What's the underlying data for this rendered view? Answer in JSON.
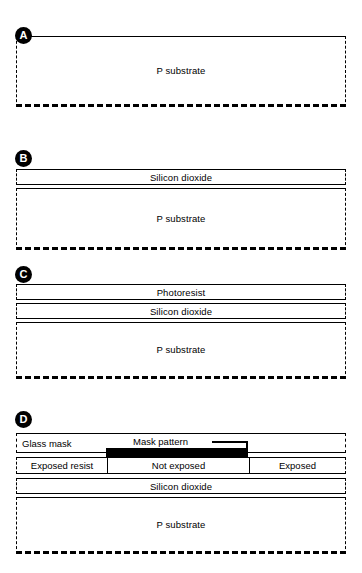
{
  "figure": {
    "background": "#ffffff",
    "ink": "#000000"
  },
  "panels": [
    {
      "id": "A",
      "badge": "A",
      "layers": [
        {
          "name": "p-substrate",
          "label": "P substrate",
          "style": "substrate"
        }
      ]
    },
    {
      "id": "B",
      "badge": "B",
      "layers": [
        {
          "name": "silicon-dioxide",
          "label": "Silicon dioxide",
          "style": "film"
        },
        {
          "name": "p-substrate",
          "label": "P substrate",
          "style": "substrate"
        }
      ]
    },
    {
      "id": "C",
      "badge": "C",
      "layers": [
        {
          "name": "photoresist",
          "label": "Photoresist",
          "style": "film"
        },
        {
          "name": "silicon-dioxide",
          "label": "Silicon dioxide",
          "style": "film"
        },
        {
          "name": "p-substrate",
          "label": "P substrate",
          "style": "substrate"
        }
      ]
    },
    {
      "id": "D",
      "badge": "D",
      "glass_mask_label": "Glass mask",
      "mask_pattern_label": "Mask pattern",
      "resist_regions": [
        {
          "name": "exposed-resist-left",
          "label": "Exposed resist"
        },
        {
          "name": "not-exposed-resist",
          "label": "Not exposed"
        },
        {
          "name": "exposed-resist-right",
          "label": "Exposed"
        }
      ],
      "layers": [
        {
          "name": "silicon-dioxide",
          "label": "Silicon dioxide",
          "style": "film"
        },
        {
          "name": "p-substrate",
          "label": "P substrate",
          "style": "substrate"
        }
      ]
    }
  ]
}
